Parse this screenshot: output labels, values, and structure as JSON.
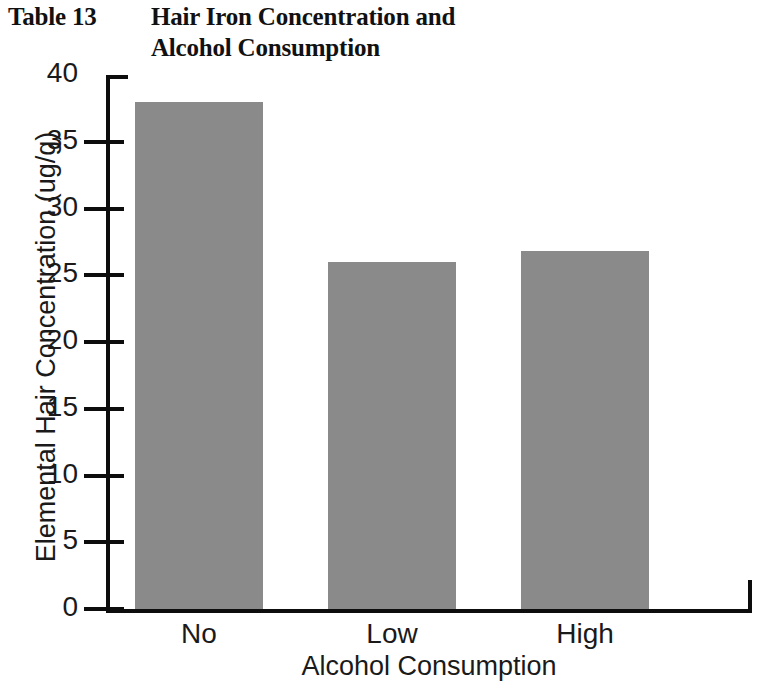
{
  "figure": {
    "table_number": "Table 13",
    "title": "Hair Iron Concentration and Alcohol Consumption"
  },
  "chart_data": {
    "type": "bar",
    "title": "Hair Iron Concentration and Alcohol Consumption",
    "categories": [
      "No",
      "Low",
      "High"
    ],
    "values": [
      38,
      26,
      26.8
    ],
    "xlabel": "Alcohol Consumption",
    "ylabel": "Elemental Hair Concentration (ug/g)",
    "ylim": [
      0,
      40
    ],
    "ytick_step": 5,
    "yticks": [
      0,
      5,
      10,
      15,
      20,
      25,
      30,
      35,
      40
    ],
    "ytick_labels": [
      "0",
      "5",
      "10",
      "15",
      "20",
      "25",
      "30",
      "35",
      "40"
    ],
    "grid": false,
    "legend": null,
    "bar_color": "#8a8a8a",
    "axis_color": "#0d0d0d",
    "background": "#ffffff"
  }
}
